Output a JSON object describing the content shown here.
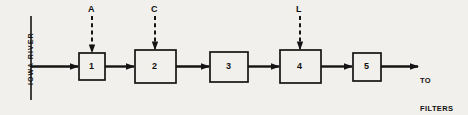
{
  "diagram": {
    "background_color": "#f2f0ec",
    "line_color": "#141414",
    "source": {
      "label": "IOWA RIVER",
      "line_x": 31,
      "line_top": 16,
      "line_bottom": 100
    },
    "output": {
      "line1": "TO",
      "line2": "FILTERS"
    },
    "units": [
      {
        "id": "unit-1",
        "label": "1",
        "x": 79,
        "y": 53,
        "w": 26,
        "h": 27
      },
      {
        "id": "unit-2",
        "label": "2",
        "x": 135,
        "y": 50,
        "w": 41,
        "h": 33
      },
      {
        "id": "unit-3",
        "label": "3",
        "x": 210,
        "y": 52,
        "w": 38,
        "h": 30
      },
      {
        "id": "unit-4",
        "label": "4",
        "x": 280,
        "y": 50,
        "w": 41,
        "h": 33
      },
      {
        "id": "unit-5",
        "label": "5",
        "x": 353,
        "y": 53,
        "w": 28,
        "h": 28
      }
    ],
    "feeds": [
      {
        "id": "feed-a",
        "label": "A",
        "x": 92,
        "top": 16,
        "bottom": 53
      },
      {
        "id": "feed-c",
        "label": "C",
        "x": 155,
        "top": 16,
        "bottom": 50
      },
      {
        "id": "feed-l",
        "label": "L",
        "x": 300,
        "top": 16,
        "bottom": 50
      }
    ]
  }
}
